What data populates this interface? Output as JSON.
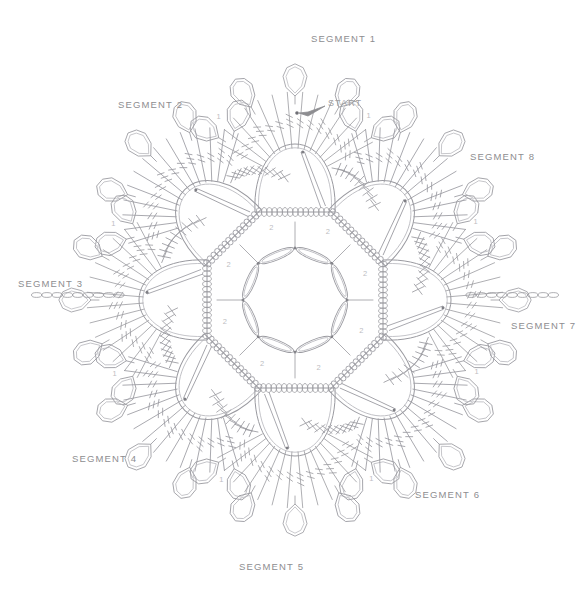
{
  "diagram": {
    "kind": "crochet-stitch-chart",
    "title_visible": false,
    "background_color": "#ffffff",
    "line_color": "#9a9aa0",
    "line_color_light": "#b5b5bb",
    "label_color": "#8d8d90",
    "start_label_color": "#a0a0a3",
    "center": {
      "x": 295,
      "y": 300
    },
    "segment_count": 8,
    "center_ring": {
      "shape": "octagon",
      "radius": 52,
      "empty": true
    }
  },
  "start_marker": {
    "label": "START",
    "x": 328,
    "y": 98,
    "arrow_from": {
      "x": 325,
      "y": 106
    },
    "arrow_to": {
      "x": 299,
      "y": 113
    },
    "dot": {
      "x": 297,
      "y": 113
    }
  },
  "segments": [
    {
      "id": 1,
      "label": "SEGMENT 1",
      "angle_deg": -90,
      "label_x": 311,
      "label_y": 33,
      "row_number": "1"
    },
    {
      "id": 2,
      "label": "SEGMENT 2",
      "angle_deg": -135,
      "label_x": 118,
      "label_y": 99,
      "row_number": "1"
    },
    {
      "id": 3,
      "label": "SEGMENT 3",
      "angle_deg": 180,
      "label_x": 18,
      "label_y": 278,
      "row_number": "1"
    },
    {
      "id": 4,
      "label": "SEGMENT 4",
      "angle_deg": 135,
      "label_x": 72,
      "label_y": 453,
      "row_number": "1"
    },
    {
      "id": 5,
      "label": "SEGMENT 5",
      "angle_deg": 90,
      "label_x": 239,
      "label_y": 561,
      "row_number": "1"
    },
    {
      "id": 6,
      "label": "SEGMENT 6",
      "angle_deg": 45,
      "label_x": 415,
      "label_y": 489,
      "row_number": "1"
    },
    {
      "id": 7,
      "label": "SEGMENT 7",
      "angle_deg": 0,
      "label_x": 511,
      "label_y": 320,
      "row_number": "1"
    },
    {
      "id": 8,
      "label": "SEGMENT 8",
      "angle_deg": -45,
      "label_x": 470,
      "label_y": 151,
      "row_number": "1"
    }
  ],
  "row_markers": {
    "inner_label": "2",
    "outer_label": "1",
    "inner_count": 8,
    "outer_count": 8
  },
  "stitch_symbols": {
    "chain": "oval-link",
    "single_crochet": "x-cross",
    "treble": "line-with-two-slashes",
    "double_treble": "line-with-three-slashes",
    "picot_loop": "rounded-polygon-loop",
    "slip_stitch": "filled-dot"
  },
  "motif": {
    "body_shape": "teardrop-shell",
    "petals_per_segment": 5,
    "fan_rays_per_segment": 14,
    "x_cluster_per_segment": 9
  }
}
